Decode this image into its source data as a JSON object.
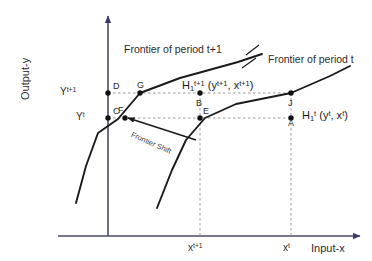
{
  "figure": {
    "title_alt": "Output-input frontier shift diagram",
    "axes": {
      "y_title": "Output-y",
      "x_title": "Input-x",
      "y_ticks": [
        {
          "id": "y-tick-t1",
          "text": "Y",
          "sup": "t+1",
          "value_px": 93
        },
        {
          "id": "y-tick-t",
          "text": "Y",
          "sup": "t",
          "value_px": 118
        }
      ],
      "x_ticks": [
        {
          "id": "x-tick-t1",
          "text": "x",
          "sup": "t+1",
          "value_px": 200
        },
        {
          "id": "x-tick-t",
          "text": "x",
          "sup": "t",
          "value_px": 291
        }
      ]
    },
    "frontiers": [
      {
        "id": "frontier-t1",
        "label": "Frontier of period t+1"
      },
      {
        "id": "frontier-t",
        "label": "Frontier of period t"
      }
    ],
    "annotations": {
      "frontier_shift": "Frontier Shift",
      "h_period_t1_base": "H",
      "h_period_t1_sub": "1",
      "h_period_t1_sup": "t+1",
      "h_period_t1_args": "(y",
      "h_period_t1_args_sup1": "t+1",
      "h_period_t1_args_mid": ", x",
      "h_period_t1_args_sup2": "t+1",
      "h_period_t1_args_end": ")",
      "h_period_t_base": "H",
      "h_period_t_sub": "1",
      "h_period_t_sup": "t",
      "h_period_t_args": "(y",
      "h_period_t_args_sup1": "t",
      "h_period_t_args_mid": ", x",
      "h_period_t_args_sup2": "t",
      "h_period_t_args_end": ")"
    },
    "points": [
      {
        "id": "point-D",
        "label": "D",
        "x": 113,
        "y": 87
      },
      {
        "id": "point-C",
        "label": "C",
        "x": 113,
        "y": 112
      },
      {
        "id": "point-G",
        "label": "G",
        "x": 139,
        "y": 86
      },
      {
        "id": "point-F",
        "label": "F",
        "x": 122,
        "y": 112
      },
      {
        "id": "point-B",
        "label": "B",
        "x": 196,
        "y": 102
      },
      {
        "id": "point-E",
        "label": "E",
        "x": 204,
        "y": 113
      },
      {
        "id": "point-A",
        "label": "A",
        "x": 240,
        "y": 121
      },
      {
        "id": "point-J",
        "label": "J",
        "x": 230,
        "y": 103
      }
    ],
    "colors": {
      "stroke": "#1a1a1a",
      "guide": "#8c8c8c",
      "text": "#1f1f1f",
      "background": "#ffffff"
    }
  }
}
